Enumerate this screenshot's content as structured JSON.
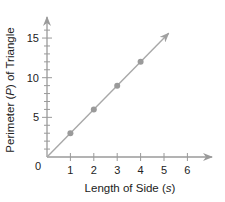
{
  "chart_data": {
    "type": "line",
    "title": "",
    "xlabel": "Length of Side (s)",
    "ylabel": "Perimeter (P) of Triangle",
    "xlabel_parts": [
      "Length of Side (",
      "s",
      ")"
    ],
    "ylabel_parts": [
      "Perimeter (",
      "P",
      ") of Triangle"
    ],
    "x_ticks": [
      1,
      2,
      3,
      4,
      5,
      6
    ],
    "y_ticks": [
      5,
      10,
      15
    ],
    "origin_label": "0",
    "xlim": [
      0,
      7
    ],
    "ylim": [
      0,
      17
    ],
    "grid": false,
    "legend": null,
    "series": [
      {
        "name": "P = 3s",
        "x": [
          1,
          2,
          3,
          4
        ],
        "y": [
          3,
          6,
          9,
          12
        ],
        "line_extends": {
          "from": [
            0,
            0
          ],
          "to": [
            5.2,
            15.6
          ],
          "arrow": true
        }
      }
    ],
    "colors": {
      "axis": "#9a9a9a",
      "line": "#a8a8a8",
      "point": "#9a9a9a",
      "text": "#222222"
    }
  }
}
